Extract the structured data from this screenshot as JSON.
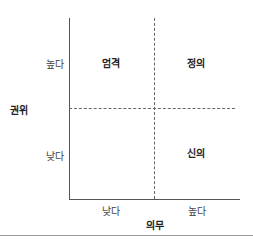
{
  "diagram": {
    "type": "2x2-matrix",
    "y_axis": {
      "title": "권위",
      "ticks": [
        {
          "label": "높다",
          "position": "top"
        },
        {
          "label": "낮다",
          "position": "bottom"
        }
      ]
    },
    "x_axis": {
      "title": "의무",
      "ticks": [
        {
          "label": "낮다",
          "position": "left"
        },
        {
          "label": "높다",
          "position": "right"
        }
      ]
    },
    "quadrants": {
      "top_left": "엄격",
      "top_right": "정의",
      "bottom_left": "",
      "bottom_right": "신의"
    }
  },
  "colors": {
    "axis": "#555555",
    "divider": "#666666",
    "separator": "#9a9a9a",
    "text": "#222222"
  }
}
